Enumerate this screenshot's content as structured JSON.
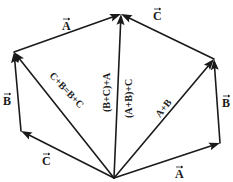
{
  "diagram": {
    "stroke_color": "#1a1a1a",
    "background": "#ffffff",
    "points": {
      "O": "origin (common tail)",
      "P1": "tip of C",
      "P2": "tip of C+B",
      "P3": "tip of A+B+C",
      "P4": "tip of A+B",
      "P5": "tip of A"
    },
    "vectors": [
      {
        "id": "A-bottom",
        "from": "O",
        "to": "P5",
        "label": "A"
      },
      {
        "id": "B-right",
        "from": "P5",
        "to": "P4",
        "label": "B"
      },
      {
        "id": "C-top-right",
        "from": "P4",
        "to": "P3",
        "label": "C"
      },
      {
        "id": "C-bottom",
        "from": "O",
        "to": "P1",
        "label": "C"
      },
      {
        "id": "B-left",
        "from": "P1",
        "to": "P2",
        "label": "B"
      },
      {
        "id": "A-top-left",
        "from": "P2",
        "to": "P3",
        "label": "A"
      },
      {
        "id": "sum-A-B",
        "from": "O",
        "to": "P4",
        "label": "A+B"
      },
      {
        "id": "sum-C-B",
        "from": "O",
        "to": "P2",
        "label": "C+B=B+C"
      },
      {
        "id": "total",
        "from": "O",
        "to": "P3",
        "label_left": "(B+C)+A",
        "label_right": "(A+B)+C"
      }
    ],
    "labels": {
      "A_top": "A",
      "C_top": "C",
      "B_left": "B",
      "B_right": "B",
      "C_bottom": "C",
      "A_bottom": "A",
      "CB_diag": "C+B=B+C",
      "BCA_vert": "(B+C)+A",
      "ABC_vert": "(A+B)+C",
      "AB_diag": "A+B"
    }
  }
}
